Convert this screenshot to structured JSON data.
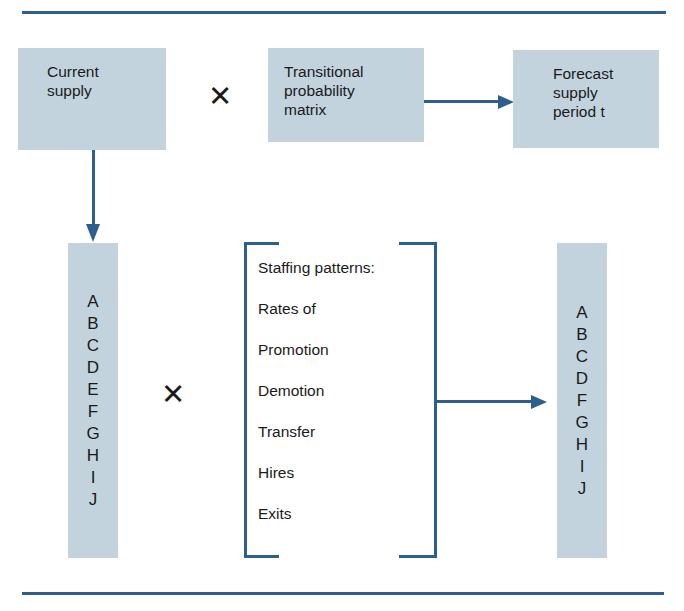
{
  "diagram": {
    "colors": {
      "rule": "#2c5f8d",
      "box_fill": "#c3d3dd",
      "arrow": "#2c5f8d",
      "text": "#1a1a1a"
    },
    "boxes": {
      "current_supply": "Current\nsupply",
      "transitional_matrix": "Transitional\nprobability\nmatrix",
      "forecast_supply": "Forecast\nsupply\nperiod t"
    },
    "operators": {
      "multiply_top": "✕",
      "multiply_middle": "✕"
    },
    "columns": {
      "left": {
        "name": "current supply levels",
        "letters": [
          "A",
          "B",
          "C",
          "D",
          "E",
          "F",
          "G",
          "H",
          "I",
          "J"
        ]
      },
      "right": {
        "name": "forecast supply levels",
        "letters": [
          "A",
          "B",
          "C",
          "D",
          "F",
          "G",
          "H",
          "I",
          "J"
        ]
      }
    },
    "bracket": {
      "lines": [
        "Staffing patterns:",
        "Rates of",
        "Promotion",
        "Demotion",
        "Transfer",
        "Hires",
        "Exits"
      ]
    }
  }
}
